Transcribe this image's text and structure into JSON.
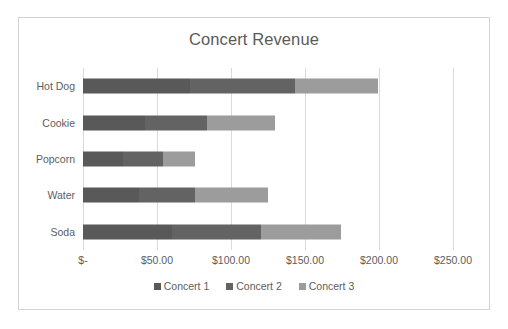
{
  "chart_data": {
    "type": "bar",
    "subtype": "stacked-horizontal-bar",
    "title": "Concert Revenue",
    "xlabel": "",
    "ylabel": "",
    "categories": [
      "Hot Dog",
      "Cookie",
      "Popcorn",
      "Water",
      "Soda"
    ],
    "category_order_top_to_bottom": [
      "Hot Dog",
      "Cookie",
      "Popcorn",
      "Water",
      "Soda"
    ],
    "series": [
      {
        "name": "Concert 1",
        "color": "#595959",
        "values": [
          72,
          42,
          27,
          38,
          60
        ]
      },
      {
        "name": "Concert 2",
        "color": "#636363",
        "values": [
          71,
          42,
          27,
          38,
          60
        ]
      },
      {
        "name": "Concert 3",
        "color": "#9c9c9c",
        "values": [
          56,
          46,
          22,
          49,
          54
        ]
      }
    ],
    "totals": [
      199,
      130,
      76,
      125,
      174
    ],
    "xlim": [
      0,
      250
    ],
    "xticks": [
      0,
      50,
      100,
      150,
      200,
      250
    ],
    "xtick_labels": [
      "$-",
      "$50.00",
      "$100.00",
      "$150.00",
      "$200.00",
      "$250.00"
    ],
    "grid": true,
    "grid_axis": "x",
    "legend_position": "bottom",
    "note": "Concert 1 and Concert 2 render as nearly identical dark grays, so their shared boundary is not visually distinguishable."
  },
  "legend": {
    "items": [
      {
        "label": "Concert 1",
        "color": "#595959"
      },
      {
        "label": "Concert 2",
        "color": "#636363"
      },
      {
        "label": "Concert 3",
        "color": "#9c9c9c"
      }
    ]
  },
  "colors": {
    "frame_border": "#d4d4d4",
    "gridline": "#d9d9d9",
    "text": "#5d5d5d",
    "title_text": "#5a5a5a",
    "background": "#ffffff"
  }
}
